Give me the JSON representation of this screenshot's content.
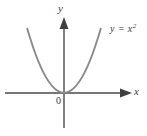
{
  "figure": {
    "title": "",
    "background_color": "#ffffff",
    "axis_color": "#4a4a4a",
    "curve_color": "#8a8a8a",
    "text_color": "#3a3a3a",
    "width": 147,
    "height": 136
  },
  "labels": {
    "y_axis": "y",
    "x_axis": "x",
    "origin": "0",
    "curve_prefix": "y = x",
    "curve_exponent": "2",
    "curve_full": "y = x²"
  },
  "chart_data": {
    "type": "line",
    "title": "",
    "xlabel": "x",
    "ylabel": "y",
    "legend": [
      "y = x²"
    ],
    "legend_position": "inline-right-of-curve",
    "grid": false,
    "equation": "y = x^2",
    "xlim": [
      -2.45,
      2.1
    ],
    "ylim": [
      -1.75,
      3.1
    ],
    "origin_label": "0",
    "axis_arrows": {
      "x": "right",
      "y": "up"
    },
    "series": [
      {
        "name": "y = x²",
        "color": "#8a8a8a",
        "x": [
          -2.45,
          -2.2,
          -2.0,
          -1.75,
          -1.5,
          -1.25,
          -1.0,
          -0.75,
          -0.5,
          -0.25,
          0.0,
          0.25,
          0.5,
          0.75,
          1.0,
          1.25,
          1.5,
          1.75,
          2.0,
          2.1
        ],
        "y": [
          6.0,
          4.84,
          4.0,
          3.06,
          2.25,
          1.56,
          1.0,
          0.56,
          0.25,
          0.06,
          0.0,
          0.06,
          0.25,
          0.56,
          1.0,
          1.56,
          2.25,
          3.06,
          4.0,
          4.41
        ]
      }
    ]
  }
}
